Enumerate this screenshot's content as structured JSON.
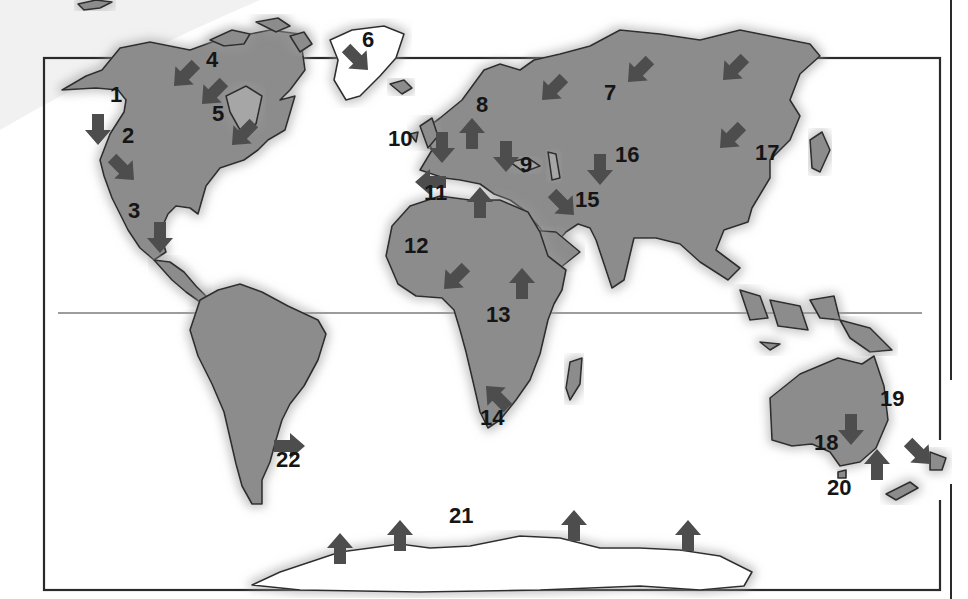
{
  "map": {
    "style": "grayscale world map with numbered dark-gray arrows",
    "colors": {
      "land": "#8c8c8c",
      "arrow": "#4d4d4d",
      "outline": "#2e2e2e",
      "label": "#151515",
      "background": "#ffffff"
    },
    "equator_line": true,
    "markers": [
      {
        "id": "1",
        "label": "1",
        "x": 110,
        "y": 102,
        "arrow": {
          "x": 98,
          "y": 128,
          "dir": "down"
        }
      },
      {
        "id": "2",
        "label": "2",
        "x": 122,
        "y": 143,
        "arrow": {
          "x": 122,
          "y": 168,
          "dir": "down-right"
        }
      },
      {
        "id": "3",
        "label": "3",
        "x": 128,
        "y": 218,
        "arrow": {
          "x": 160,
          "y": 236,
          "dir": "down"
        }
      },
      {
        "id": "4",
        "label": "4",
        "x": 206,
        "y": 67,
        "arrow": {
          "x": 186,
          "y": 74,
          "dir": "down-left"
        }
      },
      {
        "id": "5",
        "label": "5",
        "x": 212,
        "y": 121,
        "arrow": {
          "x": 214,
          "y": 92,
          "dir": "down-left"
        }
      },
      {
        "id": "5b",
        "label": "",
        "x": 0,
        "y": 0,
        "arrow": {
          "x": 244,
          "y": 133,
          "dir": "down-left"
        }
      },
      {
        "id": "6",
        "label": "6",
        "x": 362,
        "y": 47,
        "arrow": {
          "x": 356,
          "y": 58,
          "dir": "down-right"
        }
      },
      {
        "id": "7",
        "label": "7",
        "x": 604,
        "y": 100,
        "arrow": {
          "x": 554,
          "y": 88,
          "dir": "down-left"
        }
      },
      {
        "id": "7b",
        "label": "",
        "x": 0,
        "y": 0,
        "arrow": {
          "x": 640,
          "y": 70,
          "dir": "down-left"
        }
      },
      {
        "id": "7c",
        "label": "",
        "x": 0,
        "y": 0,
        "arrow": {
          "x": 735,
          "y": 68,
          "dir": "down-left"
        }
      },
      {
        "id": "8",
        "label": "8",
        "x": 476,
        "y": 112,
        "arrow": {
          "x": 472,
          "y": 135,
          "dir": "up"
        }
      },
      {
        "id": "9",
        "label": "9",
        "x": 520,
        "y": 172,
        "arrow": {
          "x": 506,
          "y": 155,
          "dir": "down"
        }
      },
      {
        "id": "10",
        "label": "10",
        "x": 388,
        "y": 146,
        "arrow": {
          "x": 442,
          "y": 146,
          "dir": "down"
        }
      },
      {
        "id": "11",
        "label": "11",
        "x": 424,
        "y": 200,
        "arrow": {
          "x": 432,
          "y": 182,
          "dir": "left"
        }
      },
      {
        "id": "11b",
        "label": "",
        "x": 0,
        "y": 0,
        "arrow": {
          "x": 480,
          "y": 204,
          "dir": "up"
        }
      },
      {
        "id": "12",
        "label": "12",
        "x": 404,
        "y": 253,
        "arrow": {
          "x": 456,
          "y": 277,
          "dir": "down-left"
        }
      },
      {
        "id": "13",
        "label": "13",
        "x": 486,
        "y": 322,
        "arrow": {
          "x": 522,
          "y": 285,
          "dir": "up"
        }
      },
      {
        "id": "14",
        "label": "14",
        "x": 480,
        "y": 425,
        "arrow": {
          "x": 498,
          "y": 398,
          "dir": "up-left"
        }
      },
      {
        "id": "15",
        "label": "15",
        "x": 575,
        "y": 207,
        "arrow": {
          "x": 562,
          "y": 203,
          "dir": "down-right"
        }
      },
      {
        "id": "16",
        "label": "16",
        "x": 615,
        "y": 162,
        "arrow": {
          "x": 600,
          "y": 168,
          "dir": "down"
        }
      },
      {
        "id": "17",
        "label": "17",
        "x": 755,
        "y": 160,
        "arrow": {
          "x": 732,
          "y": 136,
          "dir": "down-left"
        }
      },
      {
        "id": "18",
        "label": "18",
        "x": 814,
        "y": 450,
        "arrow": {
          "x": 851,
          "y": 428,
          "dir": "down"
        }
      },
      {
        "id": "19",
        "label": "19",
        "x": 880,
        "y": 406,
        "arrow": {
          "x": 918,
          "y": 452,
          "dir": "down-right"
        }
      },
      {
        "id": "20",
        "label": "20",
        "x": 827,
        "y": 495,
        "arrow": {
          "x": 877,
          "y": 466,
          "dir": "up"
        }
      },
      {
        "id": "21",
        "label": "21",
        "x": 449,
        "y": 523,
        "arrow": {
          "x": 340,
          "y": 550,
          "dir": "up"
        }
      },
      {
        "id": "21b",
        "label": "",
        "x": 0,
        "y": 0,
        "arrow": {
          "x": 400,
          "y": 537,
          "dir": "up"
        }
      },
      {
        "id": "21c",
        "label": "",
        "x": 0,
        "y": 0,
        "arrow": {
          "x": 574,
          "y": 527,
          "dir": "up"
        }
      },
      {
        "id": "21d",
        "label": "",
        "x": 0,
        "y": 0,
        "arrow": {
          "x": 688,
          "y": 537,
          "dir": "up"
        }
      },
      {
        "id": "22",
        "label": "22",
        "x": 276,
        "y": 467,
        "arrow": {
          "x": 288,
          "y": 446,
          "dir": "right"
        }
      }
    ]
  }
}
